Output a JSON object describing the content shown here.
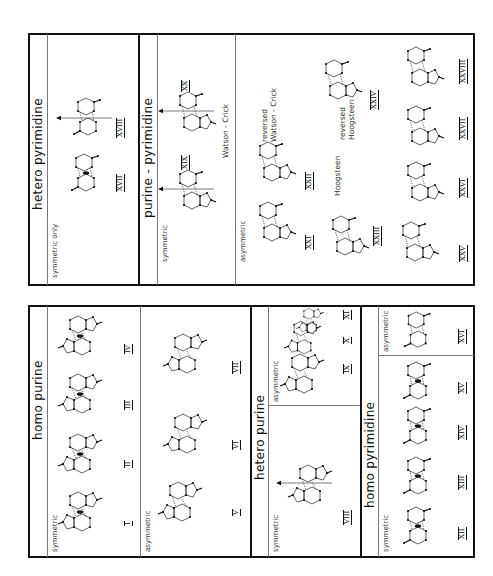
{
  "figure": {
    "orientation": "rotated 90° counter-clockwise",
    "line_color": "#111111",
    "divider_color": "#777777"
  },
  "top_box": {
    "hetero_pyrimidine": {
      "title": "hetero   pyrimidine",
      "symmetric_label": "symmetric only",
      "structures": [
        {
          "id": "XVII",
          "label": "XVII"
        },
        {
          "id": "XVIII",
          "label": "XVIII"
        }
      ]
    },
    "purine_pyrimidine": {
      "title": "purine - pyrimidine",
      "symmetric_label": "symmetric",
      "symmetric_note": "Watson - Crick",
      "symmetric_structures": [
        {
          "id": "XIX",
          "label": "XIX"
        },
        {
          "id": "XX",
          "label": "XX"
        }
      ],
      "asymmetric_label": "asymmetric",
      "notes": {
        "reversed_wc_1": "reversed",
        "reversed_wc_2": "Watson - Crick",
        "hoogsteen": "Hoogsteen",
        "reversed_h_1": "reversed",
        "reversed_h_2": "Hoogsteen"
      },
      "asymmetric_structures": [
        {
          "id": "XXI",
          "label": "XXI"
        },
        {
          "id": "XXII",
          "label": "XXII"
        },
        {
          "id": "XXIII",
          "label": "XXIII"
        },
        {
          "id": "XXIV",
          "label": "XXIV"
        },
        {
          "id": "XXV",
          "label": "XXV"
        },
        {
          "id": "XXVI",
          "label": "XXVI"
        },
        {
          "id": "XXVII",
          "label": "XXVII"
        },
        {
          "id": "XXVIII",
          "label": "XXVIII"
        }
      ]
    }
  },
  "bottom_box": {
    "homo_purine": {
      "title": "homo   purine",
      "symmetric_label": "symmetric",
      "symmetric_structures": [
        {
          "id": "I",
          "label": "I"
        },
        {
          "id": "II",
          "label": "II"
        },
        {
          "id": "III",
          "label": "III"
        },
        {
          "id": "IV",
          "label": "IV"
        }
      ],
      "asymmetric_label": "asymmetric",
      "asymmetric_structures": [
        {
          "id": "V",
          "label": "V"
        },
        {
          "id": "VI",
          "label": "VI"
        },
        {
          "id": "VII",
          "label": "VII"
        }
      ]
    },
    "hetero_purine": {
      "title": "hetero   purine",
      "symmetric_label": "symmetric",
      "symmetric_structures": [
        {
          "id": "VIII",
          "label": "VIII"
        }
      ],
      "asymmetric_label": "asymmetric",
      "asymmetric_structures": [
        {
          "id": "IX",
          "label": "IX"
        },
        {
          "id": "X",
          "label": "X"
        },
        {
          "id": "XI",
          "label": "XI"
        }
      ]
    },
    "homo_pyrimidine": {
      "title": "homo   pyrimidine",
      "symmetric_label": "symmetric",
      "symmetric_structures": [
        {
          "id": "XII",
          "label": "XII"
        },
        {
          "id": "XIII",
          "label": "XIII"
        },
        {
          "id": "XIV",
          "label": "XIV"
        },
        {
          "id": "XV",
          "label": "XV"
        }
      ],
      "asymmetric_label": "asymmetric",
      "asymmetric_structures": [
        {
          "id": "XVI",
          "label": "XVI"
        }
      ]
    }
  }
}
